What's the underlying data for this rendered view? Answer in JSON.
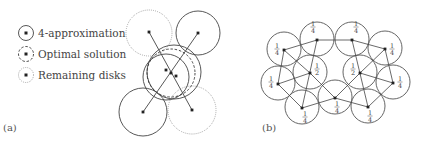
{
  "figure_a": {
    "caption": "(a)",
    "legend": [
      {
        "label": "4-approximation",
        "style": "solid"
      },
      {
        "label": "Optimal solution",
        "style": "dashed"
      },
      {
        "label": "Remaining disks",
        "style": "dotted"
      }
    ],
    "disks": [
      {
        "cx": 149,
        "cy": 33,
        "r": 23,
        "style": "dotted"
      },
      {
        "cx": 198,
        "cy": 33,
        "r": 22,
        "style": "solid"
      },
      {
        "cx": 143,
        "cy": 112,
        "r": 24,
        "style": "solid"
      },
      {
        "cx": 192,
        "cy": 110,
        "r": 24,
        "style": "dotted"
      },
      {
        "cx": 174,
        "cy": 72,
        "r": 27,
        "style": "solid"
      },
      {
        "cx": 166,
        "cy": 77,
        "r": 23,
        "style": "solid"
      },
      {
        "cx": 171,
        "cy": 73,
        "r": 24,
        "style": "dashed"
      }
    ],
    "points": [
      [
        149,
        32
      ],
      [
        198,
        33
      ],
      [
        143,
        112
      ],
      [
        192,
        110
      ],
      [
        166,
        70
      ],
      [
        171,
        73
      ],
      [
        176,
        76
      ]
    ],
    "edges": [
      [
        [
          149,
          32
        ],
        [
          192,
          110
        ]
      ],
      [
        [
          198,
          33
        ],
        [
          143,
          112
        ]
      ]
    ]
  },
  "figure_b": {
    "caption": "(b)",
    "radius": 17,
    "nodes": [
      {
        "id": "A",
        "x": 317,
        "y": 40,
        "weight": "1/4",
        "lx": 313,
        "ly": 27
      },
      {
        "id": "B",
        "x": 352,
        "y": 40,
        "weight": "1/4",
        "lx": 356,
        "ly": 27
      },
      {
        "id": "C",
        "x": 284,
        "y": 50,
        "weight": "1/4",
        "lx": 277,
        "ly": 49
      },
      {
        "id": "D",
        "x": 385,
        "y": 49,
        "weight": "1/4",
        "lx": 392,
        "ly": 49
      },
      {
        "id": "E",
        "x": 310,
        "y": 73,
        "weight": "1/2",
        "lx": 317,
        "ly": 69
      },
      {
        "id": "F",
        "x": 360,
        "y": 73,
        "weight": "1/2",
        "lx": 353,
        "ly": 69
      },
      {
        "id": "G",
        "x": 278,
        "y": 84,
        "weight": "1/4",
        "lx": 271,
        "ly": 82
      },
      {
        "id": "H",
        "x": 393,
        "y": 83,
        "weight": "1/4",
        "lx": 400,
        "ly": 82
      },
      {
        "id": "I",
        "x": 302,
        "y": 108,
        "weight": "1/4",
        "lx": 305,
        "ly": 117
      },
      {
        "id": "J",
        "x": 335,
        "y": 98,
        "weight": "1/4",
        "lx": 337,
        "ly": 107
      },
      {
        "id": "K",
        "x": 368,
        "y": 107,
        "weight": "1/4",
        "lx": 370,
        "ly": 116
      }
    ],
    "edges": [
      [
        "A",
        "B"
      ],
      [
        "A",
        "C"
      ],
      [
        "A",
        "I"
      ],
      [
        "C",
        "E"
      ],
      [
        "C",
        "G"
      ],
      [
        "E",
        "G"
      ],
      [
        "E",
        "J"
      ],
      [
        "G",
        "I"
      ],
      [
        "I",
        "J"
      ],
      [
        "J",
        "K"
      ],
      [
        "J",
        "F"
      ],
      [
        "B",
        "D"
      ],
      [
        "B",
        "K"
      ],
      [
        "D",
        "F"
      ],
      [
        "D",
        "H"
      ],
      [
        "F",
        "H"
      ],
      [
        "H",
        "K"
      ]
    ]
  }
}
